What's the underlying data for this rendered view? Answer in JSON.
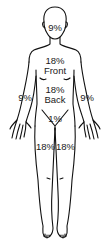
{
  "diagram": {
    "line_color": "#111111",
    "background": "#ffffff",
    "labels": {
      "head": "9%",
      "torso_front_pct": "18%",
      "torso_front_word": "Front",
      "torso_back_pct": "18%",
      "torso_back_word": "Back",
      "left_arm": "9%",
      "right_arm": "9%",
      "groin": "1%",
      "left_leg": "18%",
      "right_leg": "18%"
    }
  }
}
